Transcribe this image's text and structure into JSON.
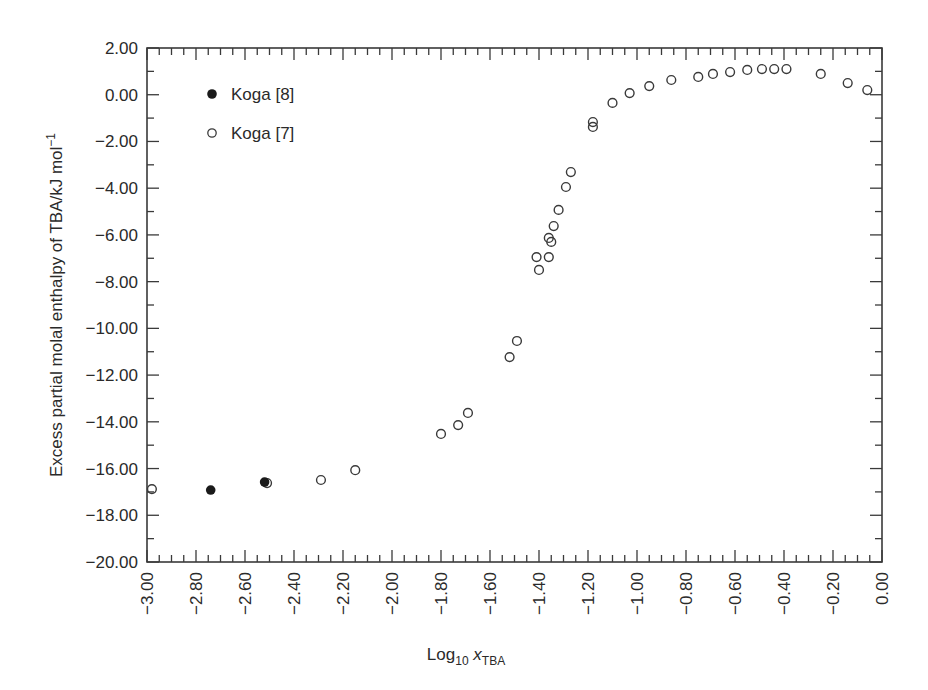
{
  "chart_data": {
    "type": "scatter",
    "title": "",
    "xlabel": "Log10 xTBA",
    "xlabel_parts": {
      "main": "Log",
      "sub1": "10",
      "var": " x",
      "sub2": "TBA"
    },
    "ylabel": "Excess partial molal enthalpy of TBA/kJ mol⁻¹",
    "ylabel_parts": {
      "main": "Excess partial molal enthalpy of TBA/kJ mol",
      "sup": "−1"
    },
    "xlim": [
      -3.0,
      0.0
    ],
    "ylim": [
      -20.0,
      2.0
    ],
    "grid": false,
    "legend_position": "upper left",
    "x_ticks": [
      "-3.00",
      "-2.80",
      "-2.60",
      "-2.40",
      "-2.20",
      "-2.00",
      "-1.80",
      "-1.60",
      "-1.40",
      "-1.20",
      "-1.00",
      "-0.80",
      "-0.60",
      "-0.40",
      "-0.20",
      "0.00"
    ],
    "x_tick_labels": [
      "−3.00",
      "−2.80",
      "−2.60",
      "−2.40",
      "−2.20",
      "−2.00",
      "−1.80",
      "−1.60",
      "−1.40",
      "−1.20",
      "−1.00",
      "−0.80",
      "−0.60",
      "−0.40",
      "−0.20",
      "0.00"
    ],
    "y_ticks": [
      "2.00",
      "0.00",
      "-2.00",
      "-4.00",
      "-6.00",
      "-8.00",
      "-10.00",
      "-12.00",
      "-14.00",
      "-16.00",
      "-18.00",
      "-20.00"
    ],
    "y_tick_labels": [
      "2.00",
      "0.00",
      "−2.00",
      "−4.00",
      "−6.00",
      "−8.00",
      "−10.00",
      "−12.00",
      "−14.00",
      "−16.00",
      "−18.00",
      "−20.00"
    ],
    "series": [
      {
        "name": "Koga [8]",
        "marker": "filled-circle",
        "color": "#1a1a1a",
        "points": [
          {
            "x": -2.74,
            "y": -16.92
          },
          {
            "x": -2.52,
            "y": -16.58
          }
        ]
      },
      {
        "name": "Koga [7]",
        "marker": "open-circle",
        "color": "#3a3a3a",
        "points": [
          {
            "x": -2.98,
            "y": -16.88
          },
          {
            "x": -2.51,
            "y": -16.62
          },
          {
            "x": -2.29,
            "y": -16.49
          },
          {
            "x": -2.15,
            "y": -16.07
          },
          {
            "x": -1.8,
            "y": -14.52
          },
          {
            "x": -1.73,
            "y": -14.14
          },
          {
            "x": -1.69,
            "y": -13.62
          },
          {
            "x": -1.52,
            "y": -11.23
          },
          {
            "x": -1.49,
            "y": -10.54
          },
          {
            "x": -1.4,
            "y": -7.5
          },
          {
            "x": -1.41,
            "y": -6.95
          },
          {
            "x": -1.36,
            "y": -6.95
          },
          {
            "x": -1.35,
            "y": -6.3
          },
          {
            "x": -1.36,
            "y": -6.13
          },
          {
            "x": -1.34,
            "y": -5.62
          },
          {
            "x": -1.32,
            "y": -4.93
          },
          {
            "x": -1.29,
            "y": -3.95
          },
          {
            "x": -1.27,
            "y": -3.31
          },
          {
            "x": -1.18,
            "y": -1.38
          },
          {
            "x": -1.18,
            "y": -1.17
          },
          {
            "x": -1.1,
            "y": -0.35
          },
          {
            "x": -1.03,
            "y": 0.07
          },
          {
            "x": -0.95,
            "y": 0.37
          },
          {
            "x": -0.86,
            "y": 0.63
          },
          {
            "x": -0.75,
            "y": 0.76
          },
          {
            "x": -0.69,
            "y": 0.89
          },
          {
            "x": -0.62,
            "y": 0.97
          },
          {
            "x": -0.55,
            "y": 1.06
          },
          {
            "x": -0.49,
            "y": 1.1
          },
          {
            "x": -0.44,
            "y": 1.1
          },
          {
            "x": -0.39,
            "y": 1.1
          },
          {
            "x": -0.25,
            "y": 0.89
          },
          {
            "x": -0.14,
            "y": 0.5
          },
          {
            "x": -0.06,
            "y": 0.2
          }
        ]
      }
    ]
  },
  "legend": {
    "items": [
      {
        "label": "Koga [8]",
        "marker": "filled-circle"
      },
      {
        "label": "Koga [7]",
        "marker": "open-circle"
      }
    ]
  },
  "colors": {
    "axis": "#3a3a3a",
    "text": "#2a2a2a",
    "filled_marker": "#1a1a1a",
    "open_marker_stroke": "#3a3a3a",
    "background": "#ffffff"
  }
}
